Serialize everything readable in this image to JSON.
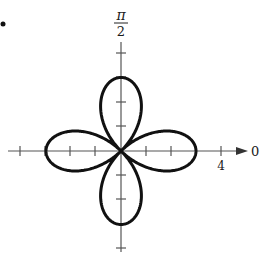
{
  "figure": {
    "bullet": "•",
    "polar_axis_label": "0",
    "vertical_axis_label_num": "π",
    "vertical_axis_label_den": "2",
    "tick_label": "4"
  },
  "chart_data": {
    "type": "polar_rose",
    "equation_form": "r = 3 cos(2θ)",
    "petals": 4,
    "petal_length": 3,
    "petal_directions": [
      "0",
      "π/2",
      "π",
      "3π/2"
    ],
    "axis_labels": {
      "polar_axis": "0",
      "vertical": "π/2"
    },
    "tick_spacing": 1,
    "labeled_ticks": [
      4
    ],
    "radial_range": [
      0,
      4
    ],
    "colors": {
      "curve": "#111111",
      "axis": "#555555",
      "background": "#ffffff"
    }
  }
}
